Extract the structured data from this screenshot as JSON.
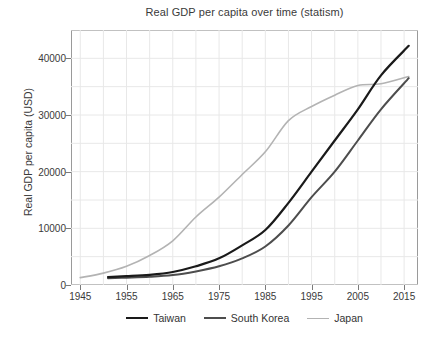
{
  "chart_data": {
    "type": "line",
    "title": "Real GDP per capita over time (statism)",
    "xlabel": "",
    "ylabel": "Real GDP per capita (USD)",
    "xlim": [
      1943,
      2018
    ],
    "ylim": [
      0,
      45000
    ],
    "xticks": [
      1945,
      1955,
      1965,
      1975,
      1985,
      1995,
      2005,
      2015
    ],
    "yticks": [
      0,
      10000,
      20000,
      30000,
      40000
    ],
    "ytick_labels": [
      "0",
      "10000",
      "20000",
      "30000",
      "40000"
    ],
    "xtick_labels": [
      "1945",
      "1955",
      "1965",
      "1975",
      "1985",
      "1995",
      "2005",
      "2015"
    ],
    "grid": true,
    "grid_minor_step": 5000,
    "grid_color": "#e8e8e8",
    "legend_position": "below",
    "series": [
      {
        "name": "Taiwan",
        "color": "#1a1a1a",
        "width": 2.2,
        "x": [
          1951,
          1955,
          1960,
          1965,
          1970,
          1975,
          1980,
          1985,
          1990,
          1995,
          2000,
          2005,
          2010,
          2016
        ],
        "y": [
          1400,
          1550,
          1800,
          2300,
          3300,
          4700,
          7000,
          9700,
          14500,
          20000,
          25500,
          31000,
          37000,
          42200
        ]
      },
      {
        "name": "South Korea",
        "color": "#4d4d4d",
        "width": 2.0,
        "x": [
          1951,
          1955,
          1960,
          1965,
          1970,
          1975,
          1980,
          1985,
          1990,
          1995,
          2000,
          2005,
          2010,
          2016
        ],
        "y": [
          1200,
          1300,
          1450,
          1750,
          2400,
          3300,
          4700,
          6800,
          10500,
          15500,
          20000,
          25500,
          31000,
          36500
        ]
      },
      {
        "name": "Japan",
        "color": "#b3b3b3",
        "width": 1.6,
        "x": [
          1945,
          1950,
          1955,
          1960,
          1965,
          1970,
          1975,
          1980,
          1985,
          1990,
          1995,
          2000,
          2005,
          2010,
          2016
        ],
        "y": [
          1300,
          2100,
          3300,
          5200,
          7800,
          12000,
          15500,
          19500,
          23500,
          29000,
          31500,
          33500,
          35200,
          35500,
          36800
        ]
      }
    ],
    "annotations": {
      "crossover": "Taiwan surpasses Japan around 2005"
    }
  },
  "legend": {
    "items": [
      {
        "label": "Taiwan",
        "color": "#1a1a1a",
        "width": "2.2px"
      },
      {
        "label": "South Korea",
        "color": "#4d4d4d",
        "width": "2.0px"
      },
      {
        "label": "Japan",
        "color": "#b3b3b3",
        "width": "1.6px"
      }
    ]
  }
}
